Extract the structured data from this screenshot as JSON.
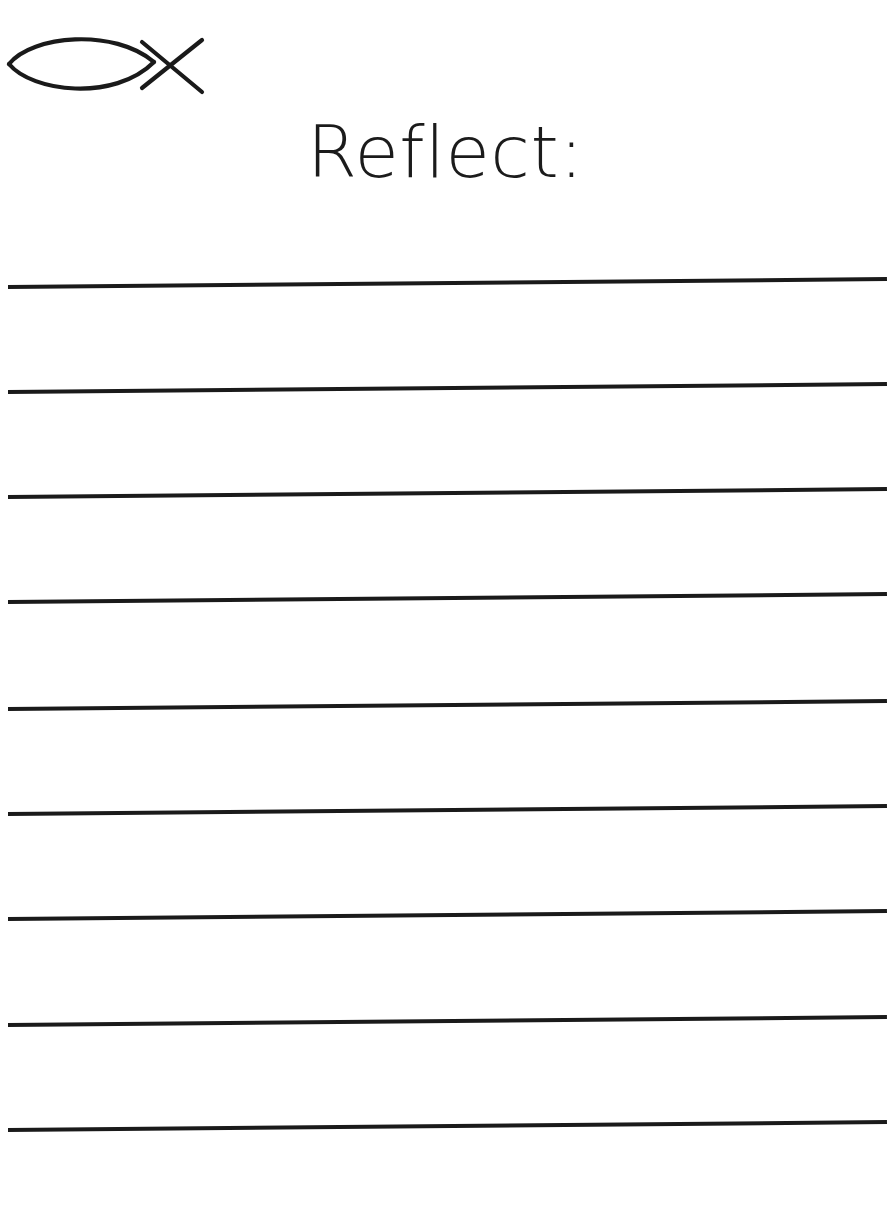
{
  "document": {
    "type": "worksheet",
    "background_color": "#ffffff",
    "ink_color": "#1a1a1a",
    "width": 891,
    "height": 1219
  },
  "logo": {
    "icon": "ichthys-fish-icon",
    "alt_text": "",
    "stroke_color": "#1a1a1a",
    "stroke_width": 4
  },
  "heading": {
    "title": "Reflect:",
    "color": "#1b1b1b",
    "align": "center",
    "font_size_px": 72
  },
  "writing_area": {
    "line_count": 9,
    "line_color": "#1a1a1a",
    "line_thickness_px": 4,
    "line_spacing_px": 105,
    "line_tilt_deg": -0.52,
    "lines": [
      {
        "index": 1,
        "top": 285,
        "value": "",
        "placeholder": ""
      },
      {
        "index": 2,
        "top": 390,
        "value": "",
        "placeholder": ""
      },
      {
        "index": 3,
        "top": 495,
        "value": "",
        "placeholder": ""
      },
      {
        "index": 4,
        "top": 600,
        "value": "",
        "placeholder": ""
      },
      {
        "index": 5,
        "top": 707,
        "value": "",
        "placeholder": ""
      },
      {
        "index": 6,
        "top": 812,
        "value": "",
        "placeholder": ""
      },
      {
        "index": 7,
        "top": 917,
        "value": "",
        "placeholder": ""
      },
      {
        "index": 8,
        "top": 1023,
        "value": "",
        "placeholder": ""
      },
      {
        "index": 9,
        "top": 1128,
        "value": "",
        "placeholder": ""
      }
    ]
  }
}
